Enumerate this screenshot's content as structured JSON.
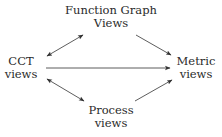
{
  "diagram": {
    "nodes": [
      {
        "id": "function-graph",
        "lines": [
          "Function Graph",
          "Views"
        ],
        "x": 111,
        "y": 4
      },
      {
        "id": "cct",
        "lines": [
          "CCT",
          "views"
        ],
        "x": 21,
        "y": 55
      },
      {
        "id": "metric",
        "lines": [
          "Metric",
          "views"
        ],
        "x": 196,
        "y": 55
      },
      {
        "id": "process",
        "lines": [
          "Process",
          "views"
        ],
        "x": 111,
        "y": 104
      }
    ],
    "edges": [
      {
        "from": "cct",
        "to": "function-graph",
        "direction": "both"
      },
      {
        "from": "function-graph",
        "to": "metric",
        "direction": "forward"
      },
      {
        "from": "cct",
        "to": "metric",
        "direction": "forward"
      },
      {
        "from": "cct",
        "to": "process",
        "direction": "both"
      },
      {
        "from": "process",
        "to": "metric",
        "direction": "forward"
      }
    ],
    "colors": {
      "text": "#2a2a2a",
      "edge": "#333333",
      "background": "#ffffff"
    }
  }
}
